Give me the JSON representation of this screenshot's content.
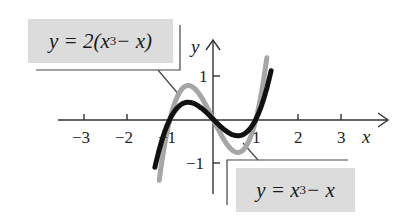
{
  "chart_data": {
    "type": "line",
    "title": "",
    "xlabel": "x",
    "ylabel": "y",
    "xlim": [
      -3.3,
      3.5
    ],
    "ylim": [
      -1.7,
      1.8
    ],
    "x_ticks": [
      "−3",
      "−2",
      "−1",
      "1",
      "2",
      "3"
    ],
    "y_ticks": [
      "1",
      "−1"
    ],
    "grid": false,
    "series": [
      {
        "name": "y = 2(x^3 − x)",
        "color": "#a6a6a6",
        "x_range": [
          -1.25,
          1.25
        ],
        "formula": "2*(x^3-x)"
      },
      {
        "name": "y = x^3 − x",
        "color": "#111111",
        "x_range": [
          -1.35,
          1.35
        ],
        "formula": "x^3-x"
      }
    ],
    "annotations": [
      {
        "text": "y = 2(x³ − x)",
        "position": "top-left"
      },
      {
        "text": "y = x³ − x",
        "position": "bottom-right"
      }
    ]
  },
  "labels": {
    "top": {
      "pre": "y = 2(x",
      "sup": "3",
      "post": " − x)"
    },
    "bottom": {
      "pre": "y = x",
      "sup": "3",
      "post": " − x"
    }
  },
  "axes": {
    "x_name": "x",
    "y_name": "y",
    "x_ticks": {
      "m3": "−3",
      "m2": "−2",
      "m1": "−1",
      "p1": "1",
      "p2": "2",
      "p3": "3"
    },
    "y_ticks": {
      "p1": "1",
      "m1": "−1"
    }
  },
  "colors": {
    "curve_scaled": "#a6a6a6",
    "curve_base": "#111111",
    "label_bg": "#dcdcdc",
    "axis": "#333333"
  }
}
